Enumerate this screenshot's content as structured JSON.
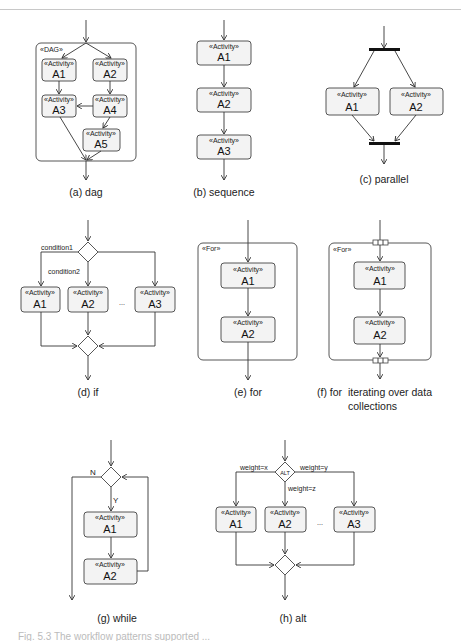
{
  "stereotype": "«Activity»",
  "panels": {
    "dag": {
      "caption": "(a) dag",
      "frame_label": "«DAG»",
      "activities": [
        "A1",
        "A2",
        "A3",
        "A4",
        "A5"
      ]
    },
    "sequence": {
      "caption": "(b) sequence",
      "activities": [
        "A1",
        "A2",
        "A3"
      ]
    },
    "parallel": {
      "caption": "(c) parallel",
      "activities": [
        "A1",
        "A2"
      ]
    },
    "if": {
      "caption": "(d) if",
      "conditions": [
        "condition1",
        "condition2"
      ],
      "ellipsis": "...",
      "activities": [
        "A1",
        "A2",
        "A3"
      ]
    },
    "for": {
      "caption": "(e) for",
      "frame_label": "«For»",
      "activities": [
        "A1",
        "A2"
      ]
    },
    "for_data": {
      "caption_line1": "(f) for  iterating over data",
      "caption_line2": "collections",
      "frame_label": "«For»",
      "activities": [
        "A1",
        "A2"
      ]
    },
    "while": {
      "caption": "(g) while",
      "branch_no": "N",
      "branch_yes": "Y",
      "activities": [
        "A1",
        "A2"
      ]
    },
    "alt": {
      "caption": "(h) alt",
      "decision_label": "ALT",
      "weights": [
        "weight=x",
        "weight=y",
        "weight=z"
      ],
      "ellipsis": "...",
      "activities": [
        "A1",
        "A2",
        "A3"
      ]
    }
  },
  "footer_caption": "Fig. 5.3  The workflow patterns supported ..."
}
